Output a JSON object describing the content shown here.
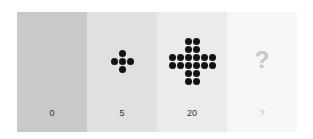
{
  "panels": [
    {
      "label": "0",
      "color": "#c9c9c9",
      "dots": 0
    },
    {
      "label": "5",
      "color": "#e0e0e0",
      "dots": 5
    },
    {
      "label": "20",
      "color": "#ebebeb",
      "dots": 20
    },
    {
      "label": "?",
      "color": "#f6f6f6",
      "question_mark": "?"
    }
  ]
}
